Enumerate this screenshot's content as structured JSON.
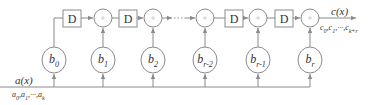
{
  "diagram": {
    "type": "polynomial multiplication circuit",
    "delay_label": "D",
    "adder_symbol": "+",
    "input": {
      "label": "a(x)",
      "sequence": "a0,a1,···,ak",
      "seq_parts": [
        "a",
        "0",
        ",a",
        "1",
        ",···,a",
        "k"
      ]
    },
    "output": {
      "label": "c(x)",
      "sequence": "c0,c1,···,ck+r",
      "seq_parts": [
        "c",
        "0",
        ",c",
        "1",
        ",···,c",
        "k+r"
      ]
    },
    "coefficients": [
      {
        "base": "b",
        "sub": "0"
      },
      {
        "base": "b",
        "sub": "1"
      },
      {
        "base": "b",
        "sub": "2"
      },
      {
        "base": "b",
        "sub": "r-2"
      },
      {
        "base": "b",
        "sub": "r-1"
      },
      {
        "base": "b",
        "sub": "r"
      }
    ],
    "delay_count": 4,
    "adder_count": 5,
    "colors": {
      "stroke": "#8a8a8a",
      "text": "#333333",
      "background": "#ffffff"
    }
  }
}
